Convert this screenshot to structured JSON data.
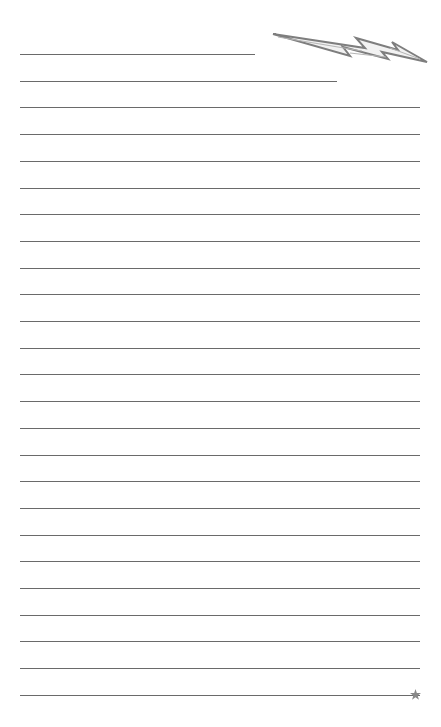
{
  "page": {
    "type": "lined writing paper",
    "background": "#ffffff",
    "line_color": "#6a6a6a",
    "line_count": 25,
    "line_left_x": 20,
    "line_right_x": 420,
    "first_line_y": 54,
    "line_spacing": 26.7,
    "short_lines": [
      {
        "index": 0,
        "right_x": 255
      },
      {
        "index": 1,
        "right_x": 337
      }
    ]
  },
  "decorations": {
    "top_right": "lightning-bolt-icon",
    "bolt_color": "#8a8a8a",
    "bottom_right": "star-icon",
    "star_color": "#888888"
  }
}
